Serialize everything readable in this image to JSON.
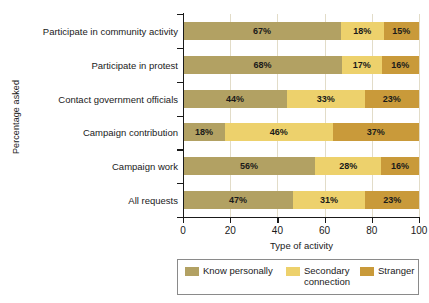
{
  "chart_data": {
    "type": "bar",
    "orientation": "horizontal",
    "stacked": true,
    "title": "",
    "xlabel": "Type of activity",
    "ylabel": "Percentage asked",
    "xlim": [
      0,
      100
    ],
    "xticks": [
      0,
      20,
      40,
      60,
      80,
      100
    ],
    "grid": true,
    "legend_position": "bottom",
    "categories": [
      "Participate in community activity",
      "Participate in protest",
      "Contact government officials",
      "Campaign contribution",
      "Campaign work",
      "All requests"
    ],
    "series": [
      {
        "name": "Know personally",
        "color": "#b2a163",
        "values": [
          67,
          68,
          44,
          18,
          56,
          47
        ],
        "labels": [
          "67%",
          "68%",
          "44%",
          "18%",
          "56%",
          "47%"
        ]
      },
      {
        "name": "Secondary connection",
        "color": "#edd16c",
        "values": [
          18,
          17,
          33,
          46,
          28,
          31
        ],
        "labels": [
          "18%",
          "17%",
          "33%",
          "46%",
          "28%",
          "31%"
        ]
      },
      {
        "name": "Stranger",
        "color": "#c99a3a",
        "values": [
          15,
          16,
          23,
          37,
          16,
          23
        ],
        "labels": [
          "15%",
          "16%",
          "23%",
          "37%",
          "16%",
          "23%"
        ]
      }
    ]
  },
  "axes": {
    "y_title": "Percentage asked",
    "x_title": "Type of activity",
    "x_tick_labels": [
      "0",
      "20",
      "40",
      "60",
      "80",
      "100"
    ]
  },
  "legend": {
    "items": [
      {
        "label": "Know personally",
        "color": "#b2a163"
      },
      {
        "label": "Secondary\nconnection",
        "color": "#edd16c"
      },
      {
        "label": "Stranger",
        "color": "#c99a3a"
      }
    ]
  }
}
